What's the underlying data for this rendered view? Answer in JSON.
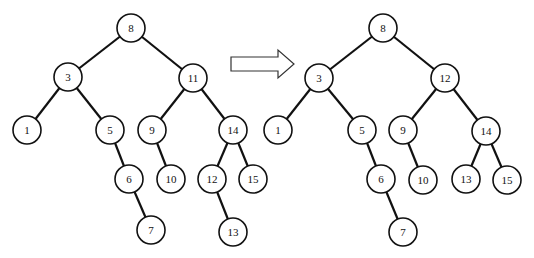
{
  "diagram": {
    "type": "binary-search-tree-transformation",
    "node_radius": 14,
    "colors": {
      "stroke": "#111111",
      "fill": "#ffffff",
      "text": "#111111"
    },
    "arrow": {
      "direction": "right",
      "from_x": 231,
      "to_x": 294,
      "y": 64
    },
    "trees": [
      {
        "id": "before",
        "nodes": [
          {
            "id": "b8",
            "label": "8",
            "x": 131,
            "y": 28
          },
          {
            "id": "b3",
            "label": "3",
            "x": 68,
            "y": 77
          },
          {
            "id": "b11",
            "label": "11",
            "x": 193,
            "y": 78
          },
          {
            "id": "b1",
            "label": "1",
            "x": 27,
            "y": 130
          },
          {
            "id": "b5",
            "label": "5",
            "x": 110,
            "y": 130
          },
          {
            "id": "b9",
            "label": "9",
            "x": 152,
            "y": 130
          },
          {
            "id": "b14",
            "label": "14",
            "x": 233,
            "y": 130
          },
          {
            "id": "b6",
            "label": "6",
            "x": 129,
            "y": 179
          },
          {
            "id": "b10",
            "label": "10",
            "x": 171,
            "y": 179
          },
          {
            "id": "b12",
            "label": "12",
            "x": 212,
            "y": 179
          },
          {
            "id": "b15",
            "label": "15",
            "x": 253,
            "y": 179
          },
          {
            "id": "b7",
            "label": "7",
            "x": 151,
            "y": 230
          },
          {
            "id": "b13",
            "label": "13",
            "x": 233,
            "y": 232
          }
        ],
        "edges": [
          [
            "b8",
            "b3"
          ],
          [
            "b8",
            "b11"
          ],
          [
            "b3",
            "b1"
          ],
          [
            "b3",
            "b5"
          ],
          [
            "b5",
            "b6"
          ],
          [
            "b6",
            "b7"
          ],
          [
            "b11",
            "b9"
          ],
          [
            "b11",
            "b14"
          ],
          [
            "b9",
            "b10"
          ],
          [
            "b14",
            "b12"
          ],
          [
            "b14",
            "b15"
          ],
          [
            "b12",
            "b13"
          ]
        ]
      },
      {
        "id": "after",
        "nodes": [
          {
            "id": "a8",
            "label": "8",
            "x": 383,
            "y": 28
          },
          {
            "id": "a3",
            "label": "3",
            "x": 319,
            "y": 78
          },
          {
            "id": "a12",
            "label": "12",
            "x": 445,
            "y": 78
          },
          {
            "id": "a1",
            "label": "1",
            "x": 278,
            "y": 130
          },
          {
            "id": "a5",
            "label": "5",
            "x": 362,
            "y": 130
          },
          {
            "id": "a9",
            "label": "9",
            "x": 403,
            "y": 130
          },
          {
            "id": "a14",
            "label": "14",
            "x": 486,
            "y": 131
          },
          {
            "id": "a6",
            "label": "6",
            "x": 381,
            "y": 179
          },
          {
            "id": "a10",
            "label": "10",
            "x": 423,
            "y": 180
          },
          {
            "id": "a13",
            "label": "13",
            "x": 466,
            "y": 179
          },
          {
            "id": "a15",
            "label": "15",
            "x": 507,
            "y": 180
          },
          {
            "id": "a7",
            "label": "7",
            "x": 403,
            "y": 232
          }
        ],
        "edges": [
          [
            "a8",
            "a3"
          ],
          [
            "a8",
            "a12"
          ],
          [
            "a3",
            "a1"
          ],
          [
            "a3",
            "a5"
          ],
          [
            "a5",
            "a6"
          ],
          [
            "a6",
            "a7"
          ],
          [
            "a12",
            "a9"
          ],
          [
            "a12",
            "a14"
          ],
          [
            "a9",
            "a10"
          ],
          [
            "a14",
            "a13"
          ],
          [
            "a14",
            "a15"
          ]
        ]
      }
    ]
  }
}
